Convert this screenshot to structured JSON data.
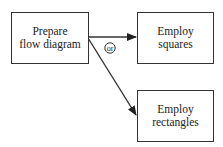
{
  "diagram": {
    "type": "flowchart",
    "nodes": [
      {
        "id": "prepare",
        "label_line1": "Prepare",
        "label_line2": "flow diagram"
      },
      {
        "id": "squares",
        "label_line1": "Employ",
        "label_line2": "squares"
      },
      {
        "id": "rectangles",
        "label_line1": "Employ",
        "label_line2": "rectangles"
      }
    ],
    "edges": [
      {
        "from": "prepare",
        "to": "squares"
      },
      {
        "from": "prepare",
        "to": "rectangles"
      }
    ],
    "connector_label": "or",
    "colors": {
      "stroke": "#333333",
      "background": "#ffffff"
    }
  }
}
